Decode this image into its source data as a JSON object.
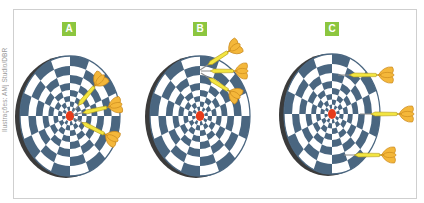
{
  "credit": "Ilustrações: AMj Studio/DBR",
  "colors": {
    "board_dark": "#4a6680",
    "board_light": "#ffffff",
    "rim": "#3b3b3b",
    "bullseye": "#e63b1a",
    "barrel": "#f2e540",
    "barrel_stroke": "#b59a1a",
    "flight": "#f4b73a",
    "flight_stroke": "#c8871a",
    "label_bg": "#8cc63f",
    "label_text": "#ffffff",
    "frame": "#cfcfcf"
  },
  "panels": [
    {
      "label": "A",
      "label_x": 62,
      "board": {
        "cx": 70,
        "cy": 116,
        "rx": 50,
        "ry": 60
      },
      "darts": [
        {
          "tip": [
            72,
            113
          ],
          "tail": [
            104,
            75
          ]
        },
        {
          "tip": [
            73,
            115
          ],
          "tail": [
            122,
            104
          ]
        },
        {
          "tip": [
            73,
            118
          ],
          "tail": [
            118,
            141
          ]
        }
      ]
    },
    {
      "label": "B",
      "label_x": 193,
      "board": {
        "cx": 200,
        "cy": 116,
        "rx": 50,
        "ry": 60
      },
      "darts": [
        {
          "tip": [
            200,
            70
          ],
          "tail": [
            240,
            44
          ]
        },
        {
          "tip": [
            201,
            71
          ],
          "tail": [
            248,
            71
          ]
        },
        {
          "tip": [
            201,
            73
          ],
          "tail": [
            240,
            98
          ]
        }
      ]
    },
    {
      "label": "C",
      "label_x": 325,
      "board": {
        "cx": 332,
        "cy": 114,
        "rx": 48,
        "ry": 60
      },
      "darts": [
        {
          "tip": [
            338,
            75
          ],
          "tail": [
            394,
            75
          ]
        },
        {
          "tip": [
            360,
            114
          ],
          "tail": [
            414,
            114
          ]
        },
        {
          "tip": [
            344,
            155
          ],
          "tail": [
            396,
            155
          ]
        }
      ]
    }
  ]
}
